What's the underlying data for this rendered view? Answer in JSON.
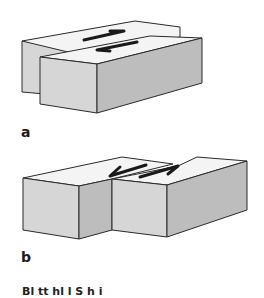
{
  "figure": {
    "panels": [
      {
        "label": "a",
        "description": "Two offset rectangular blocks side by side with opposing arrows on top (strike-slip)"
      },
      {
        "label": "b",
        "description": "Two blocks end to end with opposing arrows on top (transform)"
      }
    ],
    "caption_fragment": "Bl   tt         hl  l         S  h        i"
  },
  "colors": {
    "top_face": "#f4f4f4",
    "front_face": "#d6d6d6",
    "side_face": "#bdbdbd",
    "outline": "#2a2a2a"
  }
}
